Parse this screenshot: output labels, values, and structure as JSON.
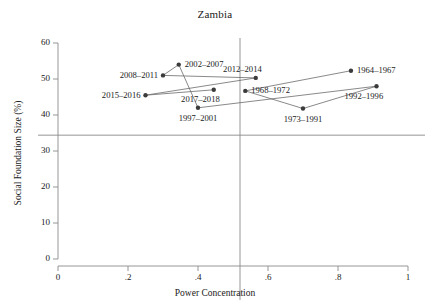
{
  "chart_data": {
    "type": "scatter",
    "title": "Zambia",
    "xlabel": "Power Concentration",
    "ylabel": "Social Foundation Size (%)",
    "xlim": [
      0,
      1
    ],
    "ylim": [
      0,
      60
    ],
    "xticks": [
      "0",
      ".2",
      ".4",
      ".6",
      ".8",
      "1"
    ],
    "xtick_values": [
      0,
      0.2,
      0.4,
      0.6,
      0.8,
      1
    ],
    "yticks": [
      "0",
      "10",
      "20",
      "30",
      "40",
      "50",
      "60"
    ],
    "ytick_values": [
      0,
      10,
      20,
      30,
      40,
      50,
      60
    ],
    "grid": false,
    "legend": "none",
    "reference_lines": [
      {
        "orientation": "horizontal",
        "value": 34.4,
        "name": "social-foundation-threshold"
      },
      {
        "orientation": "vertical",
        "value": 0.52,
        "name": "power-concentration-threshold"
      }
    ],
    "points": [
      {
        "label": "2015–2016",
        "x": 0.25,
        "y": 45.5,
        "label_side": "left"
      },
      {
        "label": "2008–2011",
        "x": 0.3,
        "y": 51.0,
        "label_side": "left"
      },
      {
        "label": "2002–2007",
        "x": 0.345,
        "y": 54.0,
        "label_side": "right"
      },
      {
        "label": "1997–2001",
        "x": 0.4,
        "y": 42.0,
        "label_side": "below"
      },
      {
        "label": "2017–2018",
        "x": 0.445,
        "y": 47.0,
        "label_side": "below-left"
      },
      {
        "label": "1968–1972",
        "x": 0.535,
        "y": 46.7,
        "label_side": "right"
      },
      {
        "label": "2012–2014",
        "x": 0.565,
        "y": 50.3,
        "label_side": "above-left"
      },
      {
        "label": "1973–1991",
        "x": 0.7,
        "y": 41.8,
        "label_side": "below"
      },
      {
        "label": "1964–1967",
        "x": 0.837,
        "y": 52.3,
        "label_side": "right"
      },
      {
        "label": "1992–1996",
        "x": 0.91,
        "y": 48.0,
        "label_side": "below-right"
      }
    ],
    "path_order": [
      "1964–1967",
      "1968–1972",
      "1973–1991",
      "1992–1996",
      "1997–2001",
      "2002–2007",
      "2008–2011",
      "2012–2014",
      "2015–2016",
      "2017–2018"
    ],
    "segments": [
      [
        "1964–1967",
        "1968–1972"
      ],
      [
        "1968–1972",
        "1973–1991"
      ],
      [
        "1973–1991",
        "1992–1996"
      ],
      [
        "1992–1996",
        "1997–2001"
      ],
      [
        "1997–2001",
        "2002–2007"
      ],
      [
        "2002–2007",
        "2008–2011"
      ],
      [
        "2008–2011",
        "2012–2014"
      ],
      [
        "2012–2014",
        "2015–2016"
      ],
      [
        "2015–2016",
        "2017–2018"
      ]
    ],
    "colors": {
      "marker": "#3b3b3b",
      "line": "#6b6b6b",
      "axis": "#8a8a8a",
      "reference_line": "#8a8a8a",
      "text": "#1a1a1a"
    }
  }
}
